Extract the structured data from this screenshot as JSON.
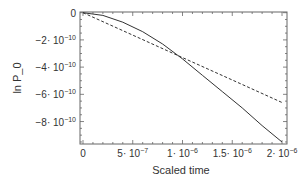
{
  "chart_data": {
    "type": "line",
    "title": "",
    "xlabel": "Scaled time",
    "ylabel": "ln P_0",
    "xlim": [
      -3e-08,
      2.05e-06
    ],
    "ylim": [
      -9.65e-10,
      5e-12
    ],
    "xticks": [
      {
        "value": 0,
        "label": "0",
        "exp": ""
      },
      {
        "value": 5e-07,
        "label": "5· 10",
        "exp": "−7"
      },
      {
        "value": 1e-06,
        "label": "1· 10",
        "exp": "−6"
      },
      {
        "value": 1.5e-06,
        "label": "1.5· 10",
        "exp": "−6"
      },
      {
        "value": 2e-06,
        "label": "2· 10",
        "exp": "−6"
      }
    ],
    "yticks": [
      {
        "value": 0,
        "label": "0",
        "exp": ""
      },
      {
        "value": -2e-10,
        "label": "−2· 10",
        "exp": "−10"
      },
      {
        "value": -4e-10,
        "label": "−4· 10",
        "exp": "−10"
      },
      {
        "value": -6e-10,
        "label": "−6· 10",
        "exp": "−10"
      },
      {
        "value": -8e-10,
        "label": "−8· 10",
        "exp": "−10"
      }
    ],
    "grid": false,
    "series": [
      {
        "name": "solid",
        "style": "solid",
        "x": [
          0,
          2e-07,
          4e-07,
          6e-07,
          8e-07,
          1e-06,
          1.2e-06,
          1.4e-06,
          1.6e-06,
          1.8e-06,
          2e-06
        ],
        "y": [
          0,
          -2e-11,
          -7e-11,
          -1.4e-10,
          -2.3e-10,
          -3.4e-10,
          -4.6e-10,
          -5.8e-10,
          -7e-10,
          -8.3e-10,
          -9.5e-10
        ]
      },
      {
        "name": "dashed",
        "style": "dashed",
        "x": [
          0,
          5e-07,
          1e-06,
          1.5e-06,
          2e-06
        ],
        "y": [
          0,
          -1.65e-10,
          -3.3e-10,
          -4.95e-10,
          -6.6e-10
        ]
      }
    ],
    "legend": "none"
  }
}
